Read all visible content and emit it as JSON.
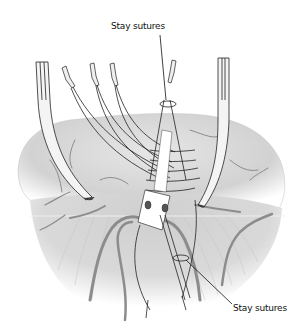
{
  "figure": {
    "type": "surgical illustration",
    "labels": [
      {
        "id": "top",
        "text": "Stay sutures"
      },
      {
        "id": "bottom",
        "text": "Stay sutures"
      }
    ],
    "colors": {
      "tissue": "#d9d9d9",
      "tissue_shadow": "#bdbdbd",
      "vessel": "#8a8a8a",
      "line": "#222222",
      "background": "#ffffff"
    }
  }
}
